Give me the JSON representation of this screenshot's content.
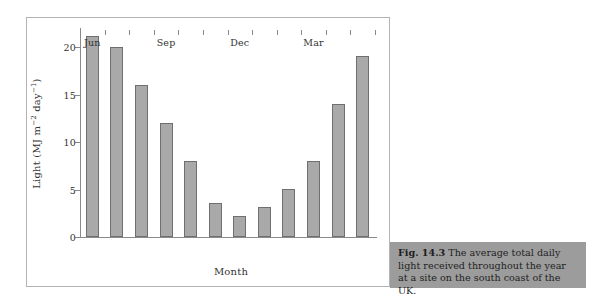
{
  "figure": {
    "caption_label": "Fig. 14.3",
    "caption_text": "The average total daily light received throughout the year at a site on the south coast of the UK."
  },
  "chart_data": {
    "type": "bar",
    "title": "",
    "xlabel": "Month",
    "ylabel": "Light (MJ m⁻² day⁻¹)",
    "ylabel_parts": {
      "prefix": "Light (MJ m",
      "sup1": "−2",
      "middle": " day",
      "sup2": "−1",
      "suffix": ")"
    },
    "categories": [
      "Jun",
      "Jul",
      "Aug",
      "Sep",
      "Oct",
      "Nov",
      "Dec",
      "Jan",
      "Feb",
      "Mar",
      "Apr",
      "May"
    ],
    "values": [
      21.2,
      20.0,
      16.0,
      12.0,
      8.0,
      3.6,
      2.2,
      3.2,
      5.1,
      8.0,
      14.0,
      19.1
    ],
    "tick_labels": [
      "Jun",
      "Sep",
      "Dec",
      "Mar"
    ],
    "tick_label_indices": [
      0,
      3,
      6,
      9
    ],
    "yticks": [
      0,
      5,
      10,
      15,
      20
    ],
    "ylim": [
      0,
      21.8
    ],
    "grid": false,
    "legend": null,
    "bar_color": "#a9a9a9",
    "bar_edge_color": "#6f6f6f",
    "axis_color": "#8a8a8a",
    "caption_bg": "#9c9c9c"
  }
}
